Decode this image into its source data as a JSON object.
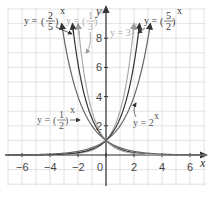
{
  "chart_data": {
    "type": "line",
    "title": "",
    "xlabel": "x",
    "ylabel": "y",
    "xlim": [
      -7,
      7
    ],
    "ylim": [
      -2,
      10
    ],
    "grid": true,
    "x_ticks": [
      "-6",
      "-4",
      "-2",
      "0",
      "2",
      "4",
      "6"
    ],
    "y_ticks": [
      "2",
      "4",
      "6",
      "8"
    ],
    "series": [
      {
        "name": "y = (2/5)^x",
        "base": 0.4,
        "color": "#333333",
        "label_num": "2",
        "label_den": "5"
      },
      {
        "name": "y = (1/3)^x",
        "base": 0.3333,
        "color": "#aaaaaa",
        "label_num": "1",
        "label_den": "3"
      },
      {
        "name": "y = (1/2)^x",
        "base": 0.5,
        "color": "#666666",
        "label_num": "1",
        "label_den": "2"
      },
      {
        "name": "y = 3^x",
        "base": 3,
        "color": "#aaaaaa",
        "label": "y = 3"
      },
      {
        "name": "y = (5/2)^x",
        "base": 2.5,
        "color": "#333333",
        "label_num": "5",
        "label_den": "2"
      },
      {
        "name": "y = 2^x",
        "base": 2,
        "color": "#666666",
        "label": "y = 2"
      }
    ]
  },
  "labels": {
    "x_axis": "x",
    "y_axis": "y",
    "eq_prefix": "y =",
    "exp": "x",
    "two_fifths": {
      "num": "2",
      "den": "5"
    },
    "one_third": {
      "num": "1",
      "den": "3"
    },
    "one_half": {
      "num": "1",
      "den": "2"
    },
    "five_halves": {
      "num": "5",
      "den": "2"
    },
    "three_x": "y = 3",
    "two_x": "y = 2"
  }
}
